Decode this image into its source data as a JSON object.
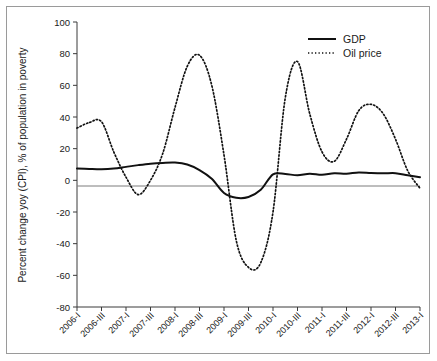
{
  "chart_data": {
    "type": "line",
    "title": "",
    "xlabel": "",
    "ylabel": "Percent change yoy (CPI), % of population in poverty",
    "ylim": [
      -80,
      100
    ],
    "yticks": [
      100,
      80,
      60,
      40,
      20,
      0,
      -20,
      -40,
      -60,
      -80
    ],
    "grid": false,
    "legend_position": "top-right",
    "x": [
      "2006-I",
      "2006-II",
      "2006-III",
      "2006-IV",
      "2007-I",
      "2007-II",
      "2007-III",
      "2007-IV",
      "2008-I",
      "2008-II",
      "2008-III",
      "2008-IV",
      "2009-I",
      "2009-II",
      "2009-III",
      "2009-IV",
      "2010-I",
      "2010-II",
      "2010-III",
      "2010-IV",
      "2011-I",
      "2011-II",
      "2011-III",
      "2011-IV",
      "2012-I",
      "2012-II",
      "2012-III",
      "2012-IV",
      "2013-I"
    ],
    "xtick_labels": [
      "2006-I",
      "2006-III",
      "2007-I",
      "2007-III",
      "2008-I",
      "2008-III",
      "2009-I",
      "2009-III",
      "2010-I",
      "2010-III",
      "2011-I",
      "2011-III",
      "2012-I",
      "2012-III",
      "2013-I"
    ],
    "series": [
      {
        "name": "GDP",
        "style": "solid",
        "color": "#111111",
        "values": [
          7.5,
          7.2,
          7.0,
          7.4,
          8.5,
          9.6,
          10.5,
          11.0,
          11.2,
          10.0,
          6.5,
          1.0,
          -8.0,
          -11.0,
          -10.5,
          -6.0,
          3.8,
          4.0,
          3.2,
          4.2,
          3.5,
          4.5,
          4.2,
          5.0,
          4.6,
          4.4,
          4.5,
          3.2,
          2.0
        ]
      },
      {
        "name": "Oil price",
        "style": "dotted",
        "color": "#111111",
        "values": [
          33.0,
          36.5,
          37.0,
          18.0,
          2.0,
          -9.0,
          0.0,
          17.0,
          46.0,
          72.0,
          79.0,
          60.0,
          16.0,
          -38.0,
          -55.0,
          -52.0,
          -20.0,
          52.0,
          75.0,
          42.0,
          18.0,
          12.0,
          26.0,
          44.0,
          48.0,
          42.0,
          26.0,
          6.0,
          -5.0
        ]
      }
    ]
  },
  "legend": {
    "items": [
      {
        "label": "GDP",
        "style": "solid"
      },
      {
        "label": "Oil price",
        "style": "dotted"
      }
    ]
  }
}
